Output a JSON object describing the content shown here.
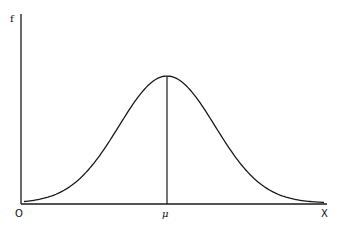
{
  "diagram": {
    "type": "normal-distribution-curve",
    "y_axis_label": "f",
    "x_axis_label": "X",
    "origin_label": "O",
    "mean_label": "μ",
    "colors": {
      "line": "#1a1a1a",
      "background": "#ffffff"
    }
  },
  "chart_data": {
    "type": "line",
    "title": "",
    "xlabel": "X",
    "ylabel": "f",
    "annotations": [
      "O",
      "μ"
    ],
    "grid": false
  }
}
